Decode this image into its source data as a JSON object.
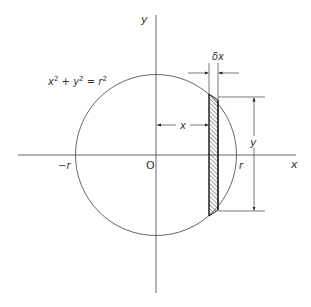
{
  "diagram": {
    "type": "geometry",
    "equation_label": {
      "base_x": "x",
      "exp_x": "2",
      "plus": " + ",
      "base_y": "y",
      "exp_y": "2",
      "equals": " = ",
      "base_r": "r",
      "exp_r": "2"
    },
    "axes": {
      "x_label": "x",
      "y_label": "y",
      "origin_label": "O"
    },
    "circle_labels": {
      "neg_r": "−r",
      "pos_r": "r"
    },
    "dimensions": {
      "strip_width": "δx",
      "strip_distance": "x",
      "strip_half_height": "y"
    },
    "colors": {
      "line": "#555555",
      "text": "#333333",
      "hatch": "#444444",
      "background": "#ffffff"
    }
  }
}
